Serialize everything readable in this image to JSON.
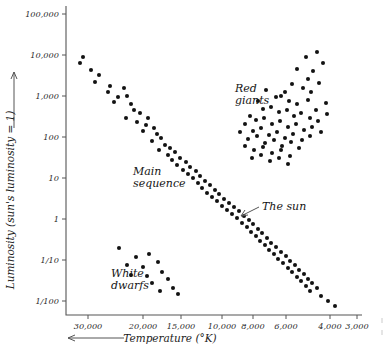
{
  "figure": {
    "kind": "hertzsprung-russell-diagram",
    "background": "#ffffff",
    "point_color": "#121212",
    "axis_color": "#555555"
  },
  "axes": {
    "y": {
      "title": "Luminosity (sun's luminosity = 1)",
      "arrow_direction": "up",
      "scale": "log",
      "ticks": [
        "100,000",
        "10,000",
        "1,000",
        "100",
        "10",
        "1",
        "1/10",
        "1/100"
      ],
      "tick_values": [
        100000,
        10000,
        1000,
        100,
        10,
        1,
        0.1,
        0.01
      ]
    },
    "x": {
      "title": "Temperature (°K)",
      "arrow_direction": "left",
      "scale": "reversed",
      "ticks": [
        "30,000",
        "20,000",
        "15,000",
        "10,000",
        "8,000",
        "6,000",
        "4,000",
        "3,000"
      ],
      "tick_values": [
        30000,
        20000,
        15000,
        10000,
        8000,
        6000,
        4000,
        3000
      ]
    }
  },
  "annotations": [
    {
      "name": "red-giants",
      "line1": "Red",
      "line2": "giants"
    },
    {
      "name": "main-sequence",
      "line1": "Main",
      "line2": "sequence"
    },
    {
      "name": "the-sun",
      "line1": "The sun",
      "line2": ""
    },
    {
      "name": "white-dwarfs",
      "line1": "White",
      "line2": "dwarfs"
    }
  ],
  "chart_data": {
    "type": "scatter",
    "title": "",
    "xlabel": "Temperature (°K)",
    "ylabel": "Luminosity (sun's luminosity = 1)",
    "xscale": "log-reversed",
    "yscale": "log",
    "xlim": [
      32000,
      2750
    ],
    "ylim": [
      0.005,
      200000
    ],
    "grid": false,
    "legend": "none",
    "xticks": [
      30000,
      20000,
      15000,
      10000,
      8000,
      6000,
      4000,
      3000
    ],
    "xticklabels": [
      "30,000",
      "20,000",
      "15,000",
      "10,000",
      "8,000",
      "6,000",
      "4,000",
      "3,000"
    ],
    "yticks": [
      100000,
      10000,
      1000,
      100,
      10,
      1,
      0.1,
      0.01
    ],
    "yticklabels": [
      "100,000",
      "10,000",
      "1,000",
      "100",
      "10",
      "1",
      "1/10",
      "1/100"
    ],
    "series": [
      {
        "name": "Main sequence",
        "points_px": [
          [
            83,
            57
          ],
          [
            80,
            63
          ],
          [
            91,
            70
          ],
          [
            99,
            75
          ],
          [
            95,
            82
          ],
          [
            110,
            86
          ],
          [
            108,
            92
          ],
          [
            124,
            88
          ],
          [
            118,
            97
          ],
          [
            127,
            96
          ],
          [
            114,
            102
          ],
          [
            131,
            104
          ],
          [
            134,
            110
          ],
          [
            140,
            113
          ],
          [
            126,
            118
          ],
          [
            137,
            122
          ],
          [
            148,
            118
          ],
          [
            146,
            125
          ],
          [
            143,
            131
          ],
          [
            154,
            128
          ],
          [
            157,
            134
          ],
          [
            152,
            141
          ],
          [
            161,
            138
          ],
          [
            165,
            145
          ],
          [
            159,
            150
          ],
          [
            170,
            148
          ],
          [
            168,
            155
          ],
          [
            175,
            152
          ],
          [
            172,
            160
          ],
          [
            180,
            158
          ],
          [
            177,
            165
          ],
          [
            186,
            162
          ],
          [
            183,
            170
          ],
          [
            190,
            167
          ],
          [
            188,
            174
          ],
          [
            196,
            171
          ],
          [
            193,
            178
          ],
          [
            200,
            176
          ],
          [
            198,
            183
          ],
          [
            205,
            181
          ],
          [
            202,
            188
          ],
          [
            210,
            185
          ],
          [
            207,
            193
          ],
          [
            215,
            190
          ],
          [
            212,
            197
          ],
          [
            219,
            194
          ],
          [
            217,
            201
          ],
          [
            224,
            199
          ],
          [
            222,
            206
          ],
          [
            229,
            203
          ],
          [
            227,
            210
          ],
          [
            234,
            207
          ],
          [
            232,
            214
          ],
          [
            239,
            211
          ],
          [
            237,
            218
          ],
          [
            244,
            216
          ],
          [
            242,
            223
          ],
          [
            249,
            220
          ],
          [
            247,
            227
          ],
          [
            253,
            224
          ],
          [
            251,
            232
          ],
          [
            258,
            229
          ],
          [
            256,
            236
          ],
          [
            262,
            233
          ],
          [
            260,
            241
          ],
          [
            267,
            238
          ],
          [
            265,
            245
          ],
          [
            271,
            243
          ],
          [
            269,
            250
          ],
          [
            276,
            247
          ],
          [
            274,
            254
          ],
          [
            281,
            252
          ],
          [
            278,
            259
          ],
          [
            286,
            256
          ],
          [
            283,
            263
          ],
          [
            290,
            261
          ],
          [
            288,
            268
          ],
          [
            295,
            265
          ],
          [
            292,
            272
          ],
          [
            299,
            270
          ],
          [
            297,
            277
          ],
          [
            304,
            274
          ],
          [
            301,
            281
          ],
          [
            308,
            279
          ],
          [
            306,
            286
          ],
          [
            312,
            283
          ],
          [
            310,
            291
          ],
          [
            317,
            288
          ],
          [
            321,
            296
          ],
          [
            328,
            301
          ],
          [
            335,
            306
          ]
        ],
        "count": 91
      },
      {
        "name": "Red giants",
        "points_px": [
          [
            306,
            57
          ],
          [
            317,
            52
          ],
          [
            323,
            63
          ],
          [
            313,
            71
          ],
          [
            308,
            79
          ],
          [
            297,
            69
          ],
          [
            303,
            88
          ],
          [
            292,
            84
          ],
          [
            311,
            92
          ],
          [
            285,
            92
          ],
          [
            319,
            83
          ],
          [
            266,
            90
          ],
          [
            276,
            97
          ],
          [
            281,
            96
          ],
          [
            289,
            101
          ],
          [
            297,
            104
          ],
          [
            308,
            100
          ],
          [
            316,
            110
          ],
          [
            326,
            103
          ],
          [
            258,
            101
          ],
          [
            263,
            109
          ],
          [
            271,
            107
          ],
          [
            279,
            112
          ],
          [
            287,
            110
          ],
          [
            294,
            116
          ],
          [
            301,
            113
          ],
          [
            310,
            118
          ],
          [
            318,
            121
          ],
          [
            327,
            114
          ],
          [
            250,
            116
          ],
          [
            256,
            120
          ],
          [
            264,
            118
          ],
          [
            272,
            124
          ],
          [
            280,
            121
          ],
          [
            288,
            127
          ],
          [
            296,
            124
          ],
          [
            304,
            130
          ],
          [
            312,
            127
          ],
          [
            321,
            132
          ],
          [
            245,
            124
          ],
          [
            253,
            131
          ],
          [
            261,
            128
          ],
          [
            269,
            135
          ],
          [
            277,
            132
          ],
          [
            285,
            138
          ],
          [
            293,
            134
          ],
          [
            302,
            140
          ],
          [
            310,
            136
          ],
          [
            240,
            132
          ],
          [
            248,
            139
          ],
          [
            257,
            136
          ],
          [
            265,
            143
          ],
          [
            274,
            140
          ],
          [
            282,
            146
          ],
          [
            291,
            142
          ],
          [
            299,
            148
          ],
          [
            245,
            146
          ],
          [
            254,
            150
          ],
          [
            263,
            147
          ],
          [
            272,
            153
          ],
          [
            281,
            150
          ],
          [
            290,
            156
          ],
          [
            252,
            158
          ],
          [
            261,
            155
          ],
          [
            270,
            161
          ],
          [
            279,
            158
          ],
          [
            288,
            164
          ]
        ],
        "count": 67
      },
      {
        "name": "White dwarfs",
        "points_px": [
          [
            119,
            248
          ],
          [
            136,
            257
          ],
          [
            149,
            254
          ],
          [
            127,
            265
          ],
          [
            143,
            267
          ],
          [
            158,
            262
          ],
          [
            131,
            275
          ],
          [
            147,
            276
          ],
          [
            162,
            272
          ],
          [
            152,
            283
          ],
          [
            168,
            279
          ],
          [
            173,
            288
          ],
          [
            160,
            291
          ],
          [
            178,
            294
          ]
        ],
        "count": 14
      }
    ]
  }
}
